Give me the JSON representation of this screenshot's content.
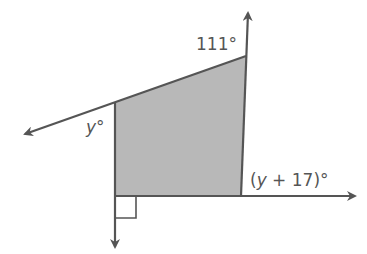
{
  "diagram": {
    "type": "polygon-exterior-angles",
    "shape": "quadrilateral",
    "fill_color": "#b8b8b8",
    "stroke_color": "#555555",
    "labels": {
      "top_right_angle": "111°",
      "left_angle_var": "y",
      "left_angle_deg": "°",
      "bottom_right_open": "(",
      "bottom_right_var": "y",
      "bottom_right_rest": " + 17)°"
    },
    "right_angle_marker": true
  }
}
